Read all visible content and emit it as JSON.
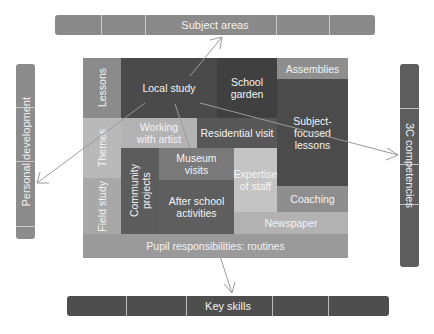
{
  "frame": {
    "top_bar": {
      "label": "Subject areas",
      "color": "#8a8a8a"
    },
    "left_bar": {
      "label": "Personal development",
      "color": "#8c8c8c"
    },
    "right_bar": {
      "label": "3C competencies",
      "color": "#5e5e5e"
    },
    "bottom_bar": {
      "label": "Key skills",
      "color": "#4e4e4e"
    }
  },
  "blocks": {
    "lessons": {
      "label": "Lessons",
      "color": "#8b8b8b"
    },
    "local_study": {
      "label": "Local study",
      "color": "#4a4a4a"
    },
    "school_garden": {
      "label": "School garden",
      "line1": "School",
      "line2": "garden",
      "color": "#404040"
    },
    "assemblies": {
      "label": "Assemblies",
      "color": "#8e8e8e"
    },
    "themes": {
      "label": "Themes",
      "color": "#b9b9b9"
    },
    "working_with_artist": {
      "line1": "Working",
      "line2": "with artist",
      "color": "#b3b3b3"
    },
    "residential_visit": {
      "label": "Residential visit",
      "color": "#575757"
    },
    "subject_focused_lessons": {
      "line1": "Subject-",
      "line2": "focused",
      "line3": "lessons",
      "color": "#4b4b4b"
    },
    "field_study": {
      "label": "Field study",
      "color": "#a8a8a8"
    },
    "community_projects": {
      "line1": "Community",
      "line2": "projects",
      "color": "#5c5c5c"
    },
    "museum_visits": {
      "line1": "Museum",
      "line2": "visits",
      "color": "#7a7a7a"
    },
    "after_school_activities": {
      "line1": "After school",
      "line2": "activities",
      "color": "#5e5e5e"
    },
    "expertise_of_staff": {
      "line1": "Expertise",
      "line2": "of staff",
      "color": "#c4c4c4"
    },
    "coaching": {
      "label": "Coaching",
      "color": "#8e8e8e"
    },
    "newspaper": {
      "label": "Newspaper",
      "color": "#b2b2b2"
    },
    "pupil_responsibilities": {
      "label": "Pupil responsibilities: routines",
      "color": "#9a9a9a"
    }
  }
}
